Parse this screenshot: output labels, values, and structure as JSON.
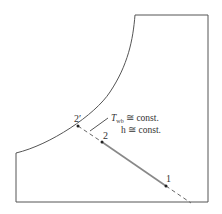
{
  "diagram": {
    "type": "psychrometric-chart-sketch",
    "labels": {
      "point_1": "1",
      "point_2": "2",
      "point_2prime": "2′",
      "twb_symbol": "T",
      "twb_subscript": "wb",
      "twb_rest": " ≅ const.",
      "h_line": "h ≅ const."
    },
    "colors": {
      "stroke": "#555555",
      "process_line": "#777777",
      "point": "#222222"
    }
  }
}
